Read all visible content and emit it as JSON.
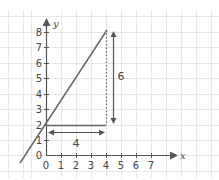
{
  "diagram": {
    "type": "coordinate-graph",
    "x_axis": {
      "label": "x",
      "ticks": [
        "0",
        "1",
        "2",
        "3",
        "4",
        "5",
        "6",
        "7"
      ]
    },
    "y_axis": {
      "label": "y",
      "ticks": [
        "0",
        "1",
        "2",
        "3",
        "4",
        "5",
        "6",
        "7",
        "8"
      ]
    },
    "line": {
      "equation": "y = 1.5x + 2",
      "slope": 1.5,
      "y_intercept": 2,
      "from": [
        -1.3,
        0.05
      ],
      "to": [
        4,
        8
      ]
    },
    "run": {
      "label": "4",
      "from": [
        0,
        2
      ],
      "to": [
        4,
        2
      ]
    },
    "rise": {
      "label": "6",
      "from": [
        4,
        2
      ],
      "to": [
        4,
        8
      ]
    },
    "colors": {
      "grid": "#e6e6e6",
      "axis": "#555555",
      "line": "#666666",
      "text": "#444444"
    }
  }
}
